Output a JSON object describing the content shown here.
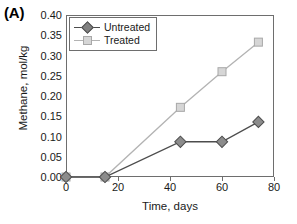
{
  "panel": {
    "label": "(A)"
  },
  "chart_data": {
    "type": "line",
    "title": "",
    "xlabel": "Time, days",
    "ylabel": "Methane, mol/kg",
    "xlim": [
      0,
      80
    ],
    "ylim": [
      0.0,
      0.4
    ],
    "xticks": [
      0,
      20,
      40,
      60,
      80
    ],
    "xticklabels": [
      "0",
      "20",
      "40",
      "60",
      "80"
    ],
    "yticks": [
      0.0,
      0.05,
      0.1,
      0.15,
      0.2,
      0.25,
      0.3,
      0.35,
      0.4
    ],
    "yticklabels": [
      "0.00",
      "0.05",
      "0.10",
      "0.15",
      "0.20",
      "0.25",
      "0.30",
      "0.35",
      "0.40"
    ],
    "grid": false,
    "legend_position": "upper left",
    "series": [
      {
        "name": "Untreated",
        "marker": "diamond",
        "color": "#808080",
        "line_color": "#4d4d4d",
        "x": [
          0,
          15,
          44,
          60,
          74
        ],
        "y": [
          0.0,
          0.0,
          0.087,
          0.087,
          0.136
        ]
      },
      {
        "name": "Treated",
        "marker": "square",
        "color": "#c9c9c9",
        "line_color": "#b3b3b3",
        "x": [
          0,
          15,
          44,
          60,
          74
        ],
        "y": [
          0.0,
          0.0,
          0.172,
          0.26,
          0.333
        ]
      }
    ]
  },
  "legend": {
    "items": [
      {
        "label": "Untreated"
      },
      {
        "label": "Treated"
      }
    ]
  }
}
